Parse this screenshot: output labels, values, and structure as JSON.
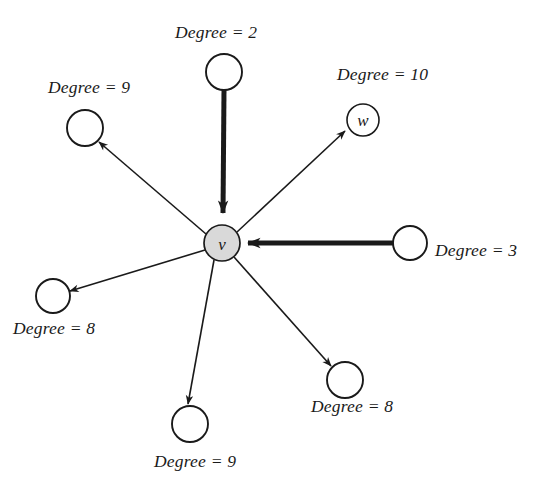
{
  "figure": {
    "type": "directed-graph",
    "background_color": "#ffffff",
    "stroke_color": "#1a1a1a",
    "center_node_fill": "#d9d9d9"
  },
  "nodes": [
    {
      "id": "center",
      "label": "v",
      "show_label": true,
      "cx": 222,
      "cy": 243,
      "r": 18,
      "fill": "#d9d9d9",
      "stroke_width": 1.6
    },
    {
      "id": "top",
      "label": "",
      "show_label": false,
      "cx": 224,
      "cy": 72,
      "r": 18,
      "fill": "#ffffff",
      "stroke_width": 1.8
    },
    {
      "id": "upper-right-w",
      "label": "w",
      "show_label": true,
      "cx": 363,
      "cy": 120,
      "r": 16,
      "fill": "#ffffff",
      "stroke_width": 1.6
    },
    {
      "id": "upper-left",
      "label": "",
      "show_label": false,
      "cx": 85,
      "cy": 128,
      "r": 18,
      "fill": "#ffffff",
      "stroke_width": 1.8
    },
    {
      "id": "right",
      "label": "",
      "show_label": false,
      "cx": 410,
      "cy": 243,
      "r": 17,
      "fill": "#ffffff",
      "stroke_width": 1.8
    },
    {
      "id": "lower-left",
      "label": "",
      "show_label": false,
      "cx": 53,
      "cy": 296,
      "r": 17,
      "fill": "#ffffff",
      "stroke_width": 1.8
    },
    {
      "id": "lower-right",
      "label": "",
      "show_label": false,
      "cx": 345,
      "cy": 380,
      "r": 18,
      "fill": "#ffffff",
      "stroke_width": 1.8
    },
    {
      "id": "bottom",
      "label": "",
      "show_label": false,
      "cx": 190,
      "cy": 424,
      "r": 18,
      "fill": "#ffffff",
      "stroke_width": 1.8
    }
  ],
  "edges": [
    {
      "id": "top-to-center",
      "from": "top",
      "to": "center",
      "direction": "into-center",
      "weight": "thick",
      "stroke_width": 5
    },
    {
      "id": "right-to-center",
      "from": "right",
      "to": "center",
      "direction": "into-center",
      "weight": "thick",
      "stroke_width": 5
    },
    {
      "id": "center-to-w",
      "from": "center",
      "to": "upper-right-w",
      "direction": "out-of-center",
      "weight": "thin",
      "stroke_width": 1.6
    },
    {
      "id": "center-to-upper-left",
      "from": "center",
      "to": "upper-left",
      "direction": "out-of-center",
      "weight": "thin",
      "stroke_width": 1.6
    },
    {
      "id": "center-to-lower-left",
      "from": "center",
      "to": "lower-left",
      "direction": "out-of-center",
      "weight": "thin",
      "stroke_width": 1.6
    },
    {
      "id": "center-to-lower-right",
      "from": "center",
      "to": "lower-right",
      "direction": "out-of-center",
      "weight": "thin",
      "stroke_width": 1.6
    },
    {
      "id": "center-to-bottom",
      "from": "center",
      "to": "bottom",
      "direction": "out-of-center",
      "weight": "thin",
      "stroke_width": 1.6
    }
  ],
  "labels": {
    "degree_word": "Degree",
    "equals": "=",
    "top": {
      "text": "Degree = 2",
      "value": "2",
      "x": 175,
      "y": 22
    },
    "upper_right": {
      "text": "Degree = 10",
      "value": "10",
      "x": 337,
      "y": 64
    },
    "upper_left": {
      "text": "Degree = 9",
      "value": "9",
      "x": 48,
      "y": 77
    },
    "right": {
      "text": "Degree = 3",
      "value": "3",
      "x": 435,
      "y": 240
    },
    "lower_left": {
      "text": "Degree = 8",
      "value": "8",
      "x": 13,
      "y": 318
    },
    "lower_right": {
      "text": "Degree = 8",
      "value": "8",
      "x": 311,
      "y": 396
    },
    "bottom": {
      "text": "Degree = 9",
      "value": "9",
      "x": 154,
      "y": 451
    }
  },
  "node_labels": {
    "center": "v",
    "w": "w"
  }
}
